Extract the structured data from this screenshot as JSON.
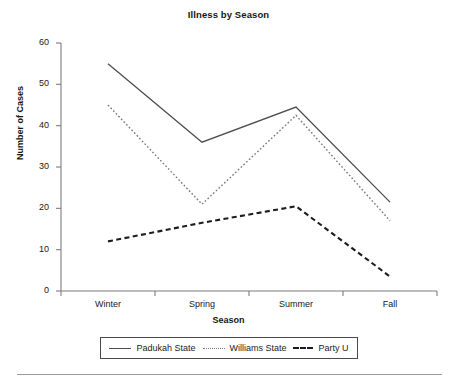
{
  "chart_data": {
    "type": "line",
    "title": "Illness by Season",
    "xlabel": "Season",
    "ylabel": "Number of Cases",
    "categories": [
      "Winter",
      "Spring",
      "Summer",
      "Fall"
    ],
    "ylim": [
      0,
      60
    ],
    "yticks": [
      0,
      10,
      20,
      30,
      40,
      50,
      60
    ],
    "grid": false,
    "legend_position": "bottom",
    "series": [
      {
        "name": "Padukah State",
        "style": "solid",
        "color": "#4d4d4d",
        "values": [
          55,
          36,
          44.5,
          21.5
        ]
      },
      {
        "name": "Williams State",
        "style": "dotted",
        "color": "#777777",
        "values": [
          45,
          21,
          42.5,
          17
        ]
      },
      {
        "name": "Party U",
        "style": "dashed",
        "color": "#1c1c1c",
        "values": [
          12,
          16.5,
          20.5,
          3.5
        ]
      }
    ]
  },
  "ytick_labels": [
    "60",
    "50",
    "40",
    "30",
    "20",
    "10",
    "0"
  ],
  "legend": {
    "items": [
      {
        "label": "Padukah State",
        "swatch": "solid-line-swatch"
      },
      {
        "label": "Williams State",
        "swatch": "dotted-line-swatch"
      },
      {
        "label": "Party U",
        "swatch": "dashed-line-swatch"
      }
    ]
  }
}
